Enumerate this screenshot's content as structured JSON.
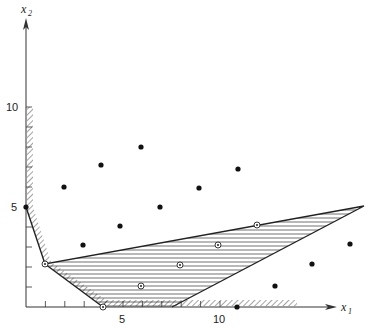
{
  "figure": {
    "x_axis_label": "x",
    "x_axis_sub": "1",
    "y_axis_label": "x",
    "y_axis_sub": "2",
    "x_ticks": [
      {
        "value": 5,
        "label": "5"
      },
      {
        "value": 10,
        "label": "10"
      }
    ],
    "y_ticks": [
      {
        "value": 5,
        "label": "5"
      },
      {
        "value": 10,
        "label": "10"
      }
    ]
  },
  "geometry": {
    "feasible_polygon_vertices": [
      [
        1,
        2.2
      ],
      [
        17.4,
        5
      ],
      [
        7.5,
        0
      ],
      [
        4,
        0
      ]
    ],
    "integer_points_outside": [
      [
        2,
        6
      ],
      [
        4,
        7.1
      ],
      [
        6,
        8
      ],
      [
        9,
        6
      ],
      [
        7,
        5
      ],
      [
        11,
        6.9
      ],
      [
        5,
        4
      ],
      [
        3,
        3.1
      ],
      [
        0,
        5
      ],
      [
        11,
        0
      ],
      [
        13,
        1.1
      ],
      [
        15,
        2.2
      ],
      [
        17,
        3.2
      ]
    ],
    "integer_points_inside": [
      [
        1,
        2.2
      ],
      [
        4,
        0
      ],
      [
        6,
        1.05
      ],
      [
        8,
        2.1
      ],
      [
        10,
        3.1
      ],
      [
        12,
        4.1
      ]
    ]
  }
}
